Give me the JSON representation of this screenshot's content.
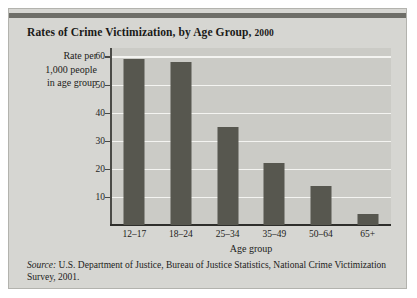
{
  "figure": {
    "title": "Rates of Crime Victimization, by Age Group,",
    "title_year": "2000",
    "source_label": "Source:",
    "source_text": " U.S. Department of Justice, Bureau of Justice Statistics, National Crime Victimization Survey, 2001.",
    "colors": {
      "panel_background": "#d6d6d2",
      "plot_background": "#cbcbc6",
      "bar_fill": "#57574f",
      "gridline": "#f4f4f1",
      "axis": "#2e2e2b",
      "top_rule": "#6e6e68",
      "text": "#1c1c1a"
    }
  },
  "chart_data": {
    "type": "bar",
    "title": "Rates of Crime Victimization, by Age Group, 2000",
    "xlabel": "Age group",
    "ylabel": "Rate per 1,000 people in age group",
    "ylabel_lines": [
      "Rate per",
      "1,000 people",
      "in age group"
    ],
    "categories": [
      "12–17",
      "18–24",
      "25–34",
      "35–49",
      "50–64",
      "65+"
    ],
    "values": [
      59,
      58,
      35,
      22,
      14,
      4
    ],
    "ylim": [
      0,
      63
    ],
    "yticks": [
      10,
      20,
      30,
      40,
      50,
      60
    ],
    "ytick_labels": [
      "10",
      "20",
      "30",
      "40",
      "50",
      "60"
    ],
    "grid": true,
    "legend": false,
    "legend_position": "none"
  }
}
